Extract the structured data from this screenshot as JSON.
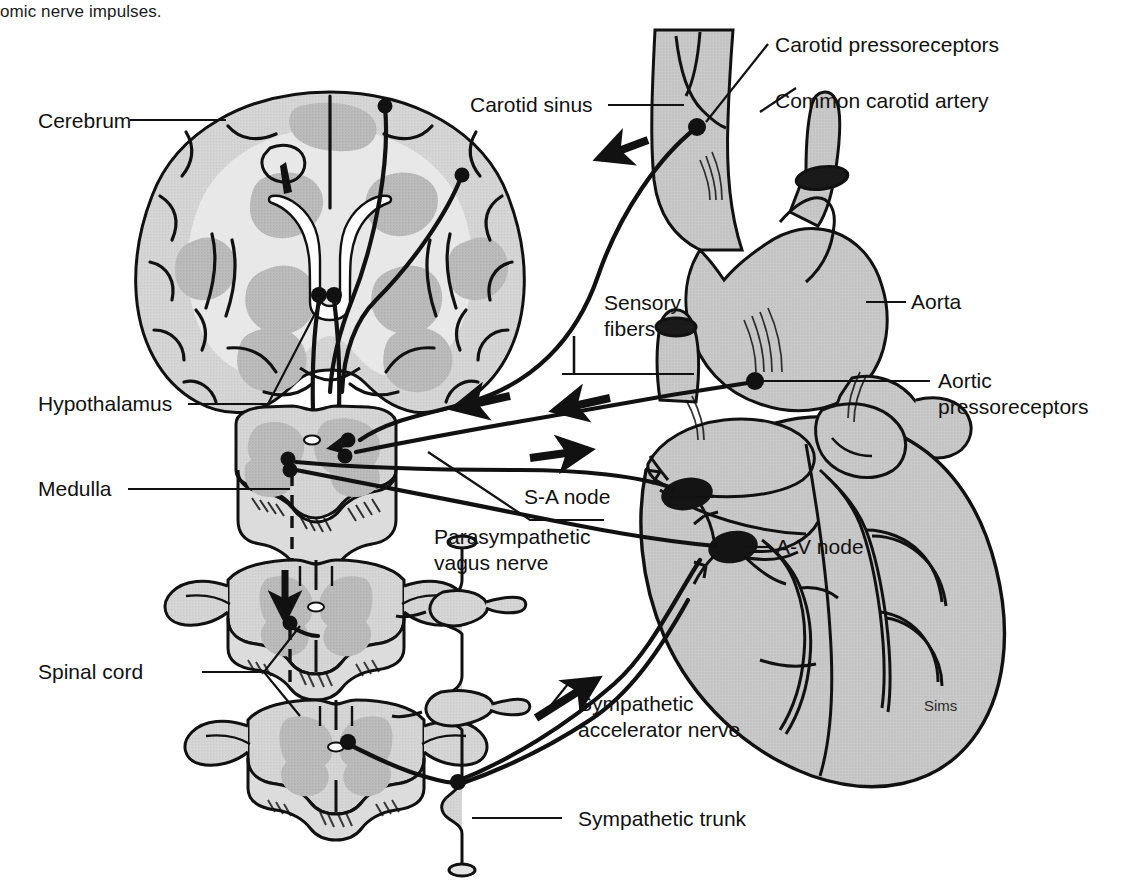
{
  "figure": {
    "caption_fragment": "omic nerve impulses.",
    "artist_signature": "Sims",
    "background_color": "#ffffff",
    "line_color": "#111111",
    "fill_light": "#d9d9d9",
    "fill_mid": "#c6c6c6",
    "fill_dark": "#b0b0b0",
    "node_color": "#151515"
  },
  "labels": {
    "cerebrum": "Cerebrum",
    "hypothalamus": "Hypothalamus",
    "medulla": "Medulla",
    "spinal_cord": "Spinal cord",
    "carotid_sinus": "Carotid sinus",
    "carotid_pressoreceptors": "Carotid pressoreceptors",
    "common_carotid_artery": "Common carotid artery",
    "aorta": "Aorta",
    "aortic_pressoreceptors_line1": "Aortic",
    "aortic_pressoreceptors_line2": "pressoreceptors",
    "sensory_fibers_line1": "Sensory",
    "sensory_fibers_line2": "fibers",
    "parasympathetic_line1": "Parasympathetic",
    "parasympathetic_line2": "vagus nerve",
    "sa_node": "S-A node",
    "av_node": "A-V node",
    "sympathetic_accelerator_line1": "Sympathetic",
    "sympathetic_accelerator_line2": "accelerator nerve",
    "sympathetic_trunk": "Sympathetic trunk"
  }
}
